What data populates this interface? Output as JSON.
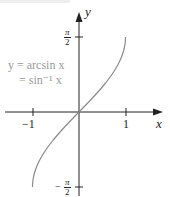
{
  "chart_data": {
    "type": "line",
    "title": "",
    "function": "y = arcsin x",
    "xlabel": "x",
    "ylabel": "y",
    "xlim": [
      -1.0,
      1.0
    ],
    "ylim": [
      -1.5708,
      1.5708
    ],
    "x_ticks": [
      {
        "value": -1,
        "label": "−1"
      },
      {
        "value": 1,
        "label": "1"
      }
    ],
    "y_ticks": [
      {
        "value": 1.5708,
        "label": "π/2"
      },
      {
        "value": -1.5708,
        "label": "−π/2"
      }
    ],
    "series": [
      {
        "name": "y = arcsin x = sin⁻¹ x",
        "color": "#8a8a8a",
        "x": [
          -1,
          -0.9,
          -0.75,
          -0.5,
          -0.25,
          0,
          0.25,
          0.5,
          0.75,
          0.9,
          1
        ],
        "y": [
          -1.5708,
          -1.1198,
          -0.8481,
          -0.5236,
          -0.2527,
          0,
          0.2527,
          0.5236,
          0.8481,
          1.1198,
          1.5708
        ]
      }
    ],
    "annotations": [
      "y = arcsin x",
      "= sin⁻¹ x"
    ],
    "grid": false,
    "legend": "none"
  },
  "labels": {
    "x_axis": "x",
    "y_axis": "y",
    "tick_neg1": "−1",
    "tick_pos1": "1",
    "pi": "π",
    "two": "2",
    "minus": "−",
    "eq_line1": "y = arcsin x",
    "eq_line2": "= sin⁻¹ x"
  },
  "colors": {
    "axis": "#222222",
    "curve": "#8a8a8a",
    "annotation": "#9a9a9a"
  }
}
